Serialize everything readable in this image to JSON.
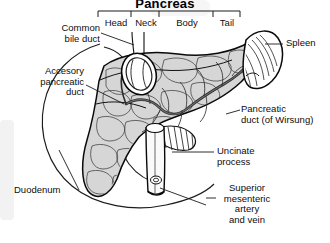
{
  "figure": {
    "title": "Pancreas",
    "type": "anatomical-illustration",
    "style": "black-and-white line drawing with gray lobular shading"
  },
  "region_bracket": {
    "name": "pancreas-regions-bracket",
    "segments": [
      {
        "label": "Head"
      },
      {
        "label": "Neck"
      },
      {
        "label": "Body"
      },
      {
        "label": "Tail"
      }
    ]
  },
  "labels": {
    "common_bile_duct": "Common\nbile duct",
    "accessory_pancreatic_duct": "Accesory\npancreatic\nduct",
    "duodenum": "Duodenum",
    "spleen": "Spleen",
    "pancreatic_duct": "Pancreatic\nduct (of Wirsung)",
    "uncinate_process": "Uncinate\nprocess",
    "superior_mesenteric": "Superior\nmesenteric\nartery\nand vein"
  },
  "colors": {
    "ink": "#000000",
    "parenchyma_fill": "#d6d6d6",
    "parenchyma_fill_light": "#e4e4e4",
    "duct_dark": "#3a3a3a",
    "background": "#ffffff",
    "leader_line": "#1a1a1a"
  }
}
